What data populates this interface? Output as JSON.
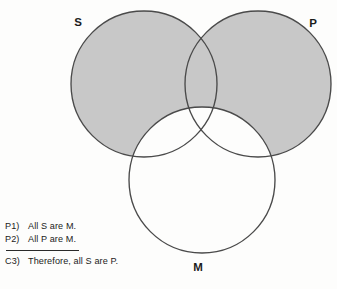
{
  "figure": {
    "type": "venn-diagram",
    "title_alt": "Three-circle Venn diagram for a categorical syllogism",
    "shaded_region_description": "S and P outside M",
    "colors": {
      "shade": "#c8c8c8",
      "outline": "#4a4a4a",
      "background": "#fdfdfc",
      "text": "#1b1b1b"
    },
    "circles": [
      {
        "id": "S",
        "label": "S",
        "cx": 144,
        "cy": 84,
        "r": 73,
        "shaded": true
      },
      {
        "id": "P",
        "label": "P",
        "cx": 258,
        "cy": 84,
        "r": 73,
        "shaded": true
      },
      {
        "id": "M",
        "label": "M",
        "cx": 202,
        "cy": 180,
        "r": 73,
        "shaded": false
      }
    ],
    "labels": [
      {
        "id": "S",
        "text": "S",
        "x": 78,
        "y": 26
      },
      {
        "id": "P",
        "text": "P",
        "x": 313,
        "y": 27
      },
      {
        "id": "M",
        "text": "M",
        "x": 198,
        "y": 271
      }
    ]
  },
  "argument": {
    "premises": [
      {
        "tag": "P1)",
        "text": "All S are M."
      },
      {
        "tag": "P2)",
        "text": "All P are M."
      }
    ],
    "conclusion": {
      "tag": "C3)",
      "text": "Therefore, all S are P."
    }
  }
}
